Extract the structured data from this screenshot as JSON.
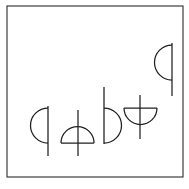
{
  "canvas": {
    "width": 189,
    "height": 189,
    "background_color": "#ffffff",
    "title": "Abstract Glyph Figure"
  },
  "frame": {
    "name": "outer-border-rectangle",
    "x": 7,
    "y": 6,
    "width": 176,
    "height": 171,
    "stroke_color": "#2b2b2b",
    "fill_color": "#ffffff",
    "stroke_width": 1.1
  },
  "style": {
    "glyph_stroke_color": "#1f1f1f",
    "glyph_stroke_width": 1.25
  },
  "glyphs": [
    {
      "id": "glyph-1",
      "label": "Semicircle bulging left with vertical stem",
      "arc_direction": "left",
      "stem_orientation": "vertical",
      "stem_x": 48,
      "stem_y_top": 106,
      "stem_y_bottom": 156,
      "arc_y_top": 108,
      "arc_y_bottom": 143,
      "arc_extent": 16,
      "arc_path": "M 48 108 A 17.5 17.5 0 0 0 48 143",
      "stem_path": "M 48 106 L 48 156"
    },
    {
      "id": "glyph-2",
      "label": "Dome semicircle bulging up with vertical stem through center",
      "arc_direction": "up",
      "stem_orientation": "vertical",
      "stem_x": 78,
      "stem_y_top": 110,
      "stem_y_bottom": 156,
      "baseline_y": 143,
      "baseline_x_left": 61,
      "baseline_x_right": 94,
      "arc_path": "M 61 143 A 16.5 16.5 0 0 1 94 143",
      "baseline_path": "M 61 143 L 94 143",
      "stem_path": "M 78 110 L 78 156"
    },
    {
      "id": "glyph-3",
      "label": "Semicircle bulging right with vertical stem extending up",
      "arc_direction": "right",
      "stem_orientation": "vertical",
      "stem_x": 104,
      "stem_y_top": 87,
      "stem_y_bottom": 144,
      "arc_y_top": 108,
      "arc_y_bottom": 143,
      "arc_extent": 16,
      "arc_path": "M 104 108 A 17.5 17.5 0 0 1 104 143",
      "stem_path": "M 104 87 L 104 144"
    },
    {
      "id": "glyph-4",
      "label": "Bowl semicircle bulging down with vertical stem through center",
      "arc_direction": "down",
      "stem_orientation": "vertical",
      "stem_x": 140,
      "stem_y_top": 95,
      "stem_y_bottom": 139,
      "baseline_y": 108,
      "baseline_x_left": 124,
      "baseline_x_right": 157,
      "arc_path": "M 124 108 A 16.5 16.5 0 0 0 157 108",
      "baseline_path": "M 124 108 L 157 108",
      "stem_path": "M 140 95 L 140 139"
    },
    {
      "id": "glyph-5",
      "label": "Semicircle bulging left with vertical stem, raised position",
      "arc_direction": "left",
      "stem_orientation": "vertical",
      "stem_x": 172,
      "stem_y_top": 43,
      "stem_y_bottom": 96,
      "arc_y_top": 45,
      "arc_y_bottom": 80,
      "arc_extent": 16,
      "arc_path": "M 172 45 A 17.5 17.5 0 0 0 172 80",
      "stem_path": "M 172 43 L 172 96"
    }
  ]
}
